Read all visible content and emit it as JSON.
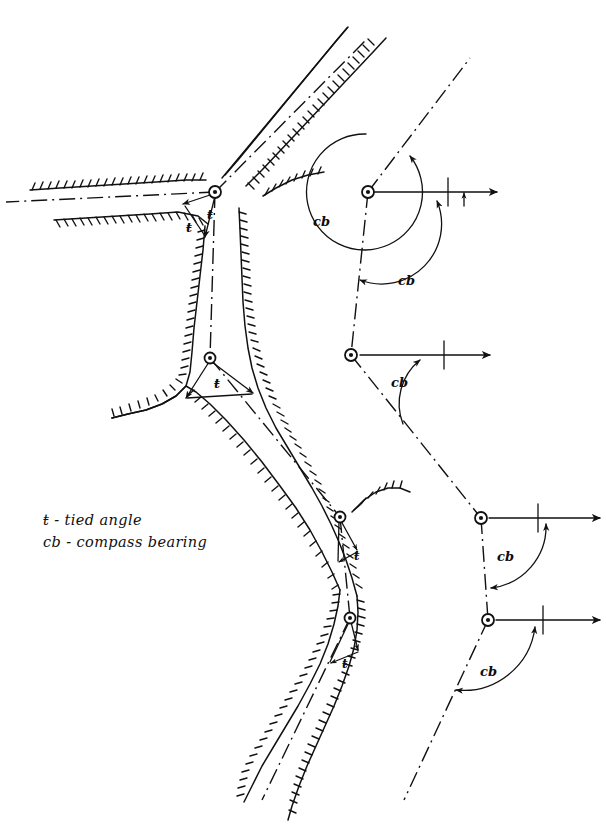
{
  "figure": {
    "kind": "hand-drawn surveying diagram",
    "background_color": "#ffffff",
    "ink_color": "#111111",
    "width": 606,
    "height": 838
  },
  "legend": {
    "items": [
      {
        "symbol": "ŧ -",
        "definition": "tied angle"
      },
      {
        "symbol": "cb -",
        "definition": "compass bearing"
      }
    ],
    "line1": "ŧ -  tied angle",
    "line2": "cb - compass bearing"
  },
  "annotations": {
    "tied_angles": [
      {
        "id": "t1",
        "label": "ŧ",
        "x": 211,
        "y": 218
      },
      {
        "id": "t2",
        "label": "ŧ",
        "x": 205,
        "y": 223
      },
      {
        "id": "t3",
        "label": "ŧ",
        "x": 216,
        "y": 387
      },
      {
        "id": "t4",
        "label": "ŧ",
        "x": 356,
        "y": 556
      },
      {
        "id": "t5",
        "label": "ŧ",
        "x": 344,
        "y": 664
      }
    ],
    "compass_bearings": [
      {
        "id": "cb1",
        "label": "cb",
        "x": 320,
        "y": 222
      },
      {
        "id": "cb2",
        "label": "cb",
        "x": 406,
        "y": 281
      },
      {
        "id": "cb3",
        "label": "cb",
        "x": 399,
        "y": 383
      },
      {
        "id": "cb4",
        "label": "cb",
        "x": 505,
        "y": 557
      },
      {
        "id": "cb5",
        "label": "cb",
        "x": 488,
        "y": 672
      }
    ]
  },
  "stations": {
    "river": [
      {
        "id": "river-station-1",
        "x": 215,
        "y": 192
      },
      {
        "id": "river-station-2",
        "x": 210,
        "y": 358
      },
      {
        "id": "river-station-3",
        "x": 340,
        "y": 517
      },
      {
        "id": "river-station-4",
        "x": 350,
        "y": 618
      }
    ],
    "traverse": [
      {
        "id": "traverse-station-1",
        "x": 368,
        "y": 192
      },
      {
        "id": "traverse-station-2",
        "x": 351,
        "y": 355
      },
      {
        "id": "traverse-station-3",
        "x": 481,
        "y": 518
      },
      {
        "id": "traverse-station-4",
        "x": 488,
        "y": 620
      }
    ]
  },
  "reference_lines": {
    "description": "horizontal meridian reference with tick and arrowhead",
    "count": 4
  }
}
